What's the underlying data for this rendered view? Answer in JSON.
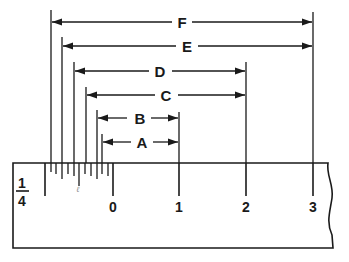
{
  "diagram": {
    "scale_fraction": {
      "numerator": "1",
      "denominator": "4"
    },
    "scale_numbers": [
      "0",
      "1",
      "2",
      "3"
    ],
    "dimensions": [
      {
        "label": "A",
        "from_x": 102,
        "to_x": 179,
        "y": 142
      },
      {
        "label": "B",
        "from_x": 97,
        "to_x": 179,
        "y": 118
      },
      {
        "label": "C",
        "from_x": 86,
        "to_x": 246,
        "y": 95
      },
      {
        "label": "D",
        "from_x": 74,
        "to_x": 246,
        "y": 70
      },
      {
        "label": "E",
        "from_x": 62,
        "to_x": 313,
        "y": 45
      },
      {
        "label": "F",
        "from_x": 51,
        "to_x": 313,
        "y": 17
      }
    ],
    "colors": {
      "line": "#1a1a1a",
      "background": "#ffffff"
    }
  }
}
